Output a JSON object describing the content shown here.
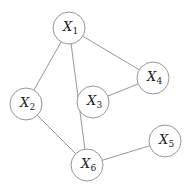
{
  "diagram": {
    "type": "undirected-graph",
    "colors": {
      "stroke": "#8a8a8a",
      "text": "#222222",
      "background": "#ffffff"
    },
    "node_radius": 16,
    "nodes": [
      {
        "id": "X1",
        "base": "X",
        "sub": "1",
        "x": 69,
        "y": 28
      },
      {
        "id": "X2",
        "base": "X",
        "sub": "2",
        "x": 26,
        "y": 104
      },
      {
        "id": "X3",
        "base": "X",
        "sub": "3",
        "x": 93,
        "y": 102
      },
      {
        "id": "X4",
        "base": "X",
        "sub": "4",
        "x": 153,
        "y": 78
      },
      {
        "id": "X5",
        "base": "X",
        "sub": "5",
        "x": 165,
        "y": 141
      },
      {
        "id": "X6",
        "base": "X",
        "sub": "6",
        "x": 87,
        "y": 165
      }
    ],
    "edges": [
      {
        "from": "X1",
        "to": "X2"
      },
      {
        "from": "X1",
        "to": "X6"
      },
      {
        "from": "X1",
        "to": "X4"
      },
      {
        "from": "X3",
        "to": "X4"
      },
      {
        "from": "X2",
        "to": "X6"
      },
      {
        "from": "X6",
        "to": "X5"
      }
    ]
  }
}
